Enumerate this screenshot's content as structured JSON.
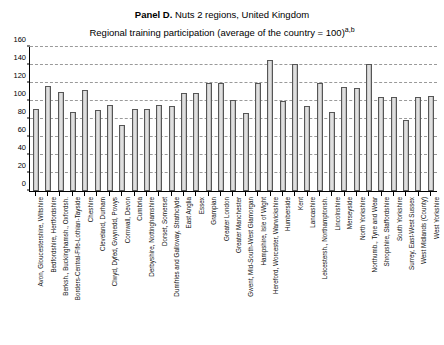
{
  "title": {
    "panel_label": "Panel D.",
    "line1_rest": " Nuts 2 regions, United Kingdom",
    "line2": "Regional training participation (average of the country = 100)",
    "line2_superscript": "a,b"
  },
  "chart_data": {
    "type": "bar",
    "title": "Panel D. Nuts 2 regions, United Kingdom",
    "subtitle": "Regional training participation (average of the country = 100) a,b",
    "xlabel": "",
    "ylabel": "",
    "ylim": [
      0,
      160
    ],
    "yticks": [
      0,
      20,
      40,
      60,
      80,
      100,
      120,
      140,
      160
    ],
    "grid": true,
    "legend": "none",
    "categories": [
      "Avon, Gloucestershire, Wiltshire",
      "Bedfordshire, Hertfordshire",
      "Berksh., Buckinghamsh., Oxfordsh.",
      "Borders-Central-Fife-Lothian-Tayside",
      "Cheshire",
      "Cleveland, Durham",
      "Clwyd, Dyfed, Gwynedd, Powys",
      "Cornwall, Devon",
      "Cumbria",
      "Derbyshire, Nottinghamshire",
      "Dorset, Somerset",
      "Dumfries and Galloway, Strathclyde",
      "East Anglia",
      "Essex",
      "Grampian",
      "Greater London",
      "Greater Manchester",
      "Gwent, Mid-South-West Glamorgan",
      "Hampshire, Isle of Wight",
      "Hereford, Worcester, Warwickshire",
      "Humberside",
      "Kent",
      "Lancashire",
      "Leicestersh., Northamptonsh.",
      "Lincolnshire",
      "Merseyside",
      "North Yorkshire",
      "Northumb., Tyne and Wear",
      "Shropshire, Staffordshire",
      "South Yorkshire",
      "Surrey, East-West Sussex",
      "West Midlands (County)",
      "West Yorkshire"
    ],
    "values": [
      91,
      117,
      110,
      88,
      112,
      90,
      96,
      73,
      91,
      91,
      96,
      95,
      109,
      109,
      120,
      120,
      101,
      87,
      120,
      146,
      100,
      141,
      94,
      120,
      88,
      116,
      114,
      141,
      105,
      104,
      79,
      104,
      106
    ]
  }
}
